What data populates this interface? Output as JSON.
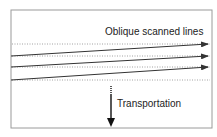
{
  "diagram": {
    "labels": {
      "scan_lines": "Oblique scanned lines",
      "transportation": "Transportation"
    },
    "colors": {
      "frame": "#9a9a9a",
      "line": "#333333",
      "dotted": "#8a8a8a",
      "text": "#222222",
      "background": "#ffffff"
    },
    "frame": {
      "x": 11,
      "y": 10,
      "width": 201,
      "height": 118
    },
    "dotted_lines_y": [
      44,
      56,
      67,
      80
    ],
    "oblique_lines": [
      {
        "x1": 11,
        "y1": 56,
        "x2": 208,
        "y2": 44
      },
      {
        "x1": 11,
        "y1": 67,
        "x2": 208,
        "y2": 56
      },
      {
        "x1": 11,
        "y1": 80,
        "x2": 208,
        "y2": 67
      }
    ],
    "transport_arrow": {
      "x": 111,
      "y_dotted_start": 86,
      "y_solid_start": 95,
      "y_end": 126
    }
  }
}
